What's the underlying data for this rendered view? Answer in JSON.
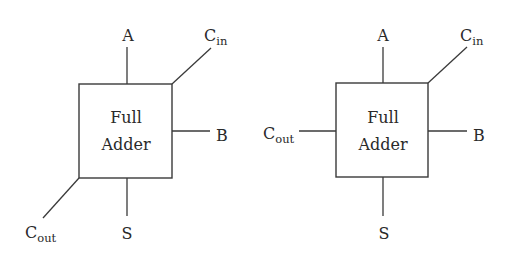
{
  "diagrams": [
    {
      "name": "full-adder-diagonal-carry",
      "block": {
        "line1": "Full",
        "line2": "Adder"
      },
      "ports": {
        "a": {
          "label": "A"
        },
        "cin": {
          "main": "C",
          "sub": "in"
        },
        "b": {
          "label": "B"
        },
        "cout": {
          "main": "C",
          "sub": "out"
        },
        "s": {
          "label": "S"
        }
      }
    },
    {
      "name": "full-adder-horizontal-carry",
      "block": {
        "line1": "Full",
        "line2": "Adder"
      },
      "ports": {
        "a": {
          "label": "A"
        },
        "cin": {
          "main": "C",
          "sub": "in"
        },
        "b": {
          "label": "B"
        },
        "cout": {
          "main": "C",
          "sub": "out"
        },
        "s": {
          "label": "S"
        }
      }
    }
  ],
  "colors": {
    "stroke": "#3a3a3a",
    "text": "#2a2a2a",
    "background": "#ffffff"
  }
}
